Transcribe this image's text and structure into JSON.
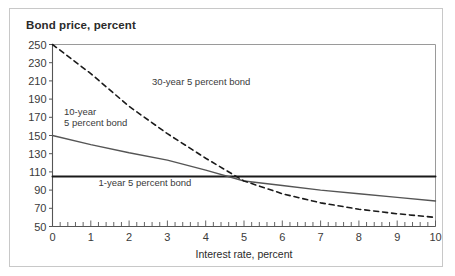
{
  "figure": {
    "background_color": "#ffffff",
    "frame_color": "#c8c8c8"
  },
  "chart_data": {
    "type": "line",
    "title": "Bond price, percent",
    "xlabel": "Interest rate, percent",
    "ylabel": "Bond price, percent",
    "xlim": [
      0,
      10
    ],
    "ylim": [
      50,
      250
    ],
    "grid": false,
    "legend_position": "inline-annotations",
    "xticks": [
      0,
      1,
      2,
      3,
      4,
      5,
      6,
      7,
      8,
      9,
      10
    ],
    "xtick_labels": [
      "0",
      "1",
      "2",
      "3",
      "4",
      "5",
      "6",
      "7",
      "8",
      "9",
      "10"
    ],
    "yticks": [
      50,
      70,
      90,
      110,
      130,
      150,
      170,
      190,
      210,
      230,
      250
    ],
    "ytick_labels": [
      "50",
      "70",
      "90",
      "110",
      "130",
      "150",
      "170",
      "190",
      "210",
      "230",
      "250"
    ],
    "x_minor_ticks_per_unit": 5,
    "series": [
      {
        "name": "1-year 5 percent bond",
        "label": "1-year 5 percent bond",
        "style": "solid",
        "color": "#1a1a1a",
        "width": 2.0,
        "x": [
          0,
          1,
          2,
          3,
          4,
          5,
          6,
          7,
          8,
          9,
          10
        ],
        "values": [
          105,
          105,
          105,
          105,
          105,
          105,
          105,
          105,
          105,
          105,
          105
        ]
      },
      {
        "name": "10-year 5 percent bond",
        "label": "10-year\n5 percent bond",
        "style": "solid",
        "color": "#555555",
        "width": 1.4,
        "x": [
          0,
          1,
          2,
          3,
          4,
          5,
          6,
          7,
          8,
          9,
          10
        ],
        "values": [
          150,
          140,
          131,
          123,
          112,
          100,
          95,
          90,
          86,
          82,
          78
        ]
      },
      {
        "name": "30-year 5 percent bond",
        "label": "30-year 5 percent bond",
        "style": "dashed",
        "color": "#1a1a1a",
        "width": 1.6,
        "x": [
          0,
          1,
          2,
          3,
          4,
          5,
          6,
          7,
          8,
          9,
          10
        ],
        "values": [
          250,
          218,
          182,
          152,
          125,
          100,
          86,
          76,
          69,
          64,
          60
        ]
      }
    ],
    "annotations": [
      {
        "text": "30-year 5 percent bond",
        "x": 2.6,
        "y": 205
      },
      {
        "text": "10-year",
        "x": 0.3,
        "y": 172
      },
      {
        "text": "5 percent bond",
        "x": 0.3,
        "y": 160
      },
      {
        "text": "1-year 5 percent bond",
        "x": 1.2,
        "y": 95
      }
    ]
  }
}
